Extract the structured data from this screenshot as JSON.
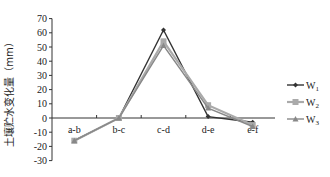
{
  "chart_data": {
    "type": "line",
    "title": "",
    "xlabel": "",
    "ylabel": "土壤贮水变化量（mm）",
    "categories": [
      "a-b",
      "b-c",
      "c-d",
      "d-e",
      "e-f"
    ],
    "series": [
      {
        "name": "W1",
        "sub": "1",
        "marker": "diamond",
        "color": "#333333",
        "values": [
          -16,
          0,
          62,
          1,
          -3
        ]
      },
      {
        "name": "W2",
        "sub": "2",
        "marker": "square",
        "color": "#aaaaaa",
        "values": [
          -16,
          0,
          54,
          9,
          -5
        ]
      },
      {
        "name": "W3",
        "sub": "3",
        "marker": "triangle",
        "color": "#888888",
        "values": [
          -16,
          0,
          51,
          7,
          -6
        ]
      }
    ],
    "ylim": [
      -30,
      70
    ],
    "yticks": [
      70,
      60,
      50,
      40,
      30,
      20,
      10,
      0,
      -10,
      -20,
      -30
    ],
    "grid": false,
    "legend_position": "right"
  }
}
